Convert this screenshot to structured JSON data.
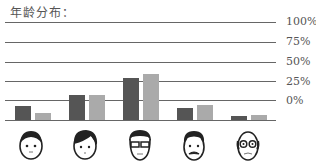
{
  "chart_data": {
    "type": "bar",
    "title": "年龄分布：",
    "xlabel": "",
    "ylabel": "",
    "ylim": [
      0,
      100
    ],
    "yticks": [
      "0%",
      "25%",
      "50%",
      "75%",
      "100%"
    ],
    "grid": true,
    "legend": null,
    "categories": [
      "child-face",
      "young-adult-face",
      "adult-glasses-face",
      "middle-aged-mustache-face",
      "elderly-bald-glasses-face"
    ],
    "series": [
      {
        "name": "series-1",
        "color": "#555555",
        "values": [
          14,
          25,
          43,
          12,
          4
        ]
      },
      {
        "name": "series-2",
        "color": "#aaaaaa",
        "values": [
          7,
          26,
          47,
          15,
          5
        ]
      }
    ]
  },
  "labels": {
    "title": "年龄分布：",
    "ticks": [
      "100%",
      "75%",
      "50%",
      "25%",
      "0%"
    ]
  }
}
